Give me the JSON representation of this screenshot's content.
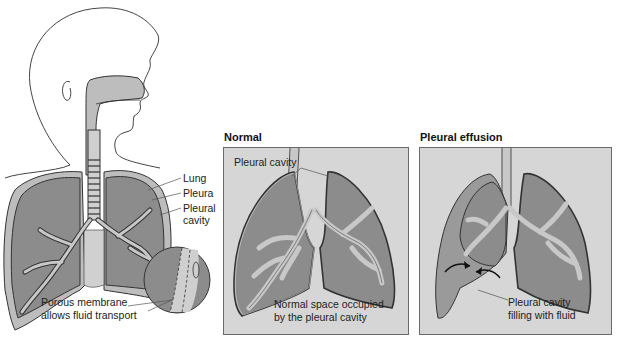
{
  "figure": {
    "left_illustration": {
      "labels": {
        "lung": "Lung",
        "pleura": "Pleura",
        "pleural_cavity_line1": "Pleural",
        "pleural_cavity_line2": "cavity",
        "membrane_line1": "Porous membrane",
        "membrane_line2": "allows fluid transport"
      }
    },
    "panels": [
      {
        "title": "Normal",
        "labels": {
          "top": "Pleural cavity",
          "bottom_line1": "Normal space occupied",
          "bottom_line2": "by the pleural cavity"
        }
      },
      {
        "title": "Pleural effusion",
        "labels": {
          "bottom_line1": "Pleural cavity",
          "bottom_line2": "filling with fluid"
        }
      }
    ],
    "colors": {
      "lung_fill": "#8c8c8c",
      "airway_fill": "#c8c8c8",
      "panel_bg": "#d6d6d6",
      "outline": "#333333",
      "fluid_fill": "#9a9a9a"
    }
  }
}
